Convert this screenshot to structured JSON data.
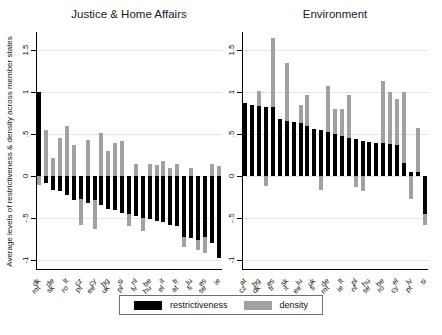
{
  "figure": {
    "y_axis_title": "Average levels of restrictiveness & density across member states",
    "colors": {
      "restrictiveness": "#000000",
      "density": "#a1a1a1",
      "gridline": "#e4e4e4"
    },
    "legend": [
      {
        "label": "restrictiveness",
        "color": "#000000"
      },
      {
        "label": "density",
        "color": "#a1a1a1"
      }
    ]
  },
  "chart_data": [
    {
      "type": "bar",
      "title": "Justice & Home Affairs",
      "categories": [
        "dk",
        "mt",
        "de",
        "sk",
        "lt",
        "ro",
        "cz",
        "pt",
        "cy",
        "ee",
        "bg",
        "uk",
        "si",
        "pl",
        "nl",
        "lv",
        "be",
        "hu",
        "it",
        "el",
        "fr",
        "at",
        "lu",
        "fi",
        "es",
        "se",
        "ie"
      ],
      "series": [
        {
          "name": "restrictiveness",
          "values": [
            1.0,
            -0.08,
            -0.16,
            -0.18,
            -0.22,
            -0.28,
            -0.27,
            -0.32,
            -0.28,
            -0.35,
            -0.39,
            -0.41,
            -0.44,
            -0.45,
            -0.48,
            -0.5,
            -0.51,
            -0.53,
            -0.55,
            -0.58,
            -0.6,
            -0.73,
            -0.74,
            -0.76,
            -0.73,
            -0.8,
            -0.98
          ]
        },
        {
          "name": "density",
          "values": [
            -0.1,
            0.55,
            0.22,
            0.45,
            0.6,
            0.37,
            -0.58,
            0.43,
            -0.63,
            0.52,
            0.3,
            0.4,
            0.42,
            -0.6,
            0.15,
            -0.65,
            0.15,
            0.13,
            0.18,
            0.1,
            0.15,
            -0.85,
            0.1,
            -0.88,
            -0.92,
            0.15,
            0.12
          ]
        }
      ],
      "ylim": [
        -1.12,
        1.72
      ],
      "yticks": [
        1.5,
        1,
        0.5,
        0,
        -0.5,
        -1
      ],
      "ytick_labels": [
        "1.5",
        "1",
        ".5",
        "0",
        "-.5",
        "-1"
      ],
      "grid": true,
      "legend_position": "bottom"
    },
    {
      "type": "bar",
      "title": "Environment",
      "categories": [
        "at",
        "cz",
        "bg",
        "dk",
        "es",
        "fr",
        "sk",
        "it",
        "lu",
        "ee",
        "uk",
        "fi",
        "de",
        "mt",
        "lt",
        "ie",
        "pl",
        "nl",
        "hu",
        "se",
        "be",
        "ro",
        "el",
        "cy",
        "lv",
        "pt",
        "si"
      ],
      "series": [
        {
          "name": "restrictiveness",
          "values": [
            0.87,
            0.85,
            0.84,
            0.83,
            0.82,
            0.68,
            0.66,
            0.65,
            0.63,
            0.6,
            0.56,
            0.55,
            0.53,
            0.5,
            0.48,
            0.46,
            0.44,
            0.42,
            0.41,
            0.4,
            0.39,
            0.38,
            0.37,
            0.16,
            0.05,
            0.05,
            -0.45
          ]
        },
        {
          "name": "density",
          "values": [
            null,
            null,
            1.02,
            -0.12,
            1.65,
            null,
            1.35,
            null,
            0.85,
            0.97,
            null,
            -0.17,
            1.08,
            0.8,
            0.8,
            0.97,
            -0.13,
            -0.18,
            null,
            null,
            1.13,
            1.0,
            0.92,
            1.0,
            -0.27,
            0.58,
            -0.58
          ]
        }
      ],
      "ylim": [
        -1.12,
        1.72
      ],
      "yticks": [
        1.5,
        1,
        0.5,
        0,
        -0.5,
        -1
      ],
      "ytick_labels": [
        "1.5",
        "1",
        ".5",
        "0",
        "-.5",
        "-1"
      ],
      "grid": true,
      "legend_position": "bottom"
    }
  ]
}
